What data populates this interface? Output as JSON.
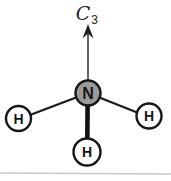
{
  "diagram": {
    "type": "molecular-structure",
    "rotation_axis_label": {
      "letter": "C",
      "subscript": "3"
    },
    "central_atom": {
      "symbol": "N"
    },
    "hydrogens": [
      {
        "symbol": "H",
        "position": "left"
      },
      {
        "symbol": "H",
        "position": "right"
      },
      {
        "symbol": "H",
        "position": "bottom"
      }
    ],
    "colors": {
      "bond": "#1c1c1c",
      "nitrogen_fill": "#9a9a9a",
      "hydrogen_fill": "#ffffff",
      "outline": "#161616",
      "scan_edge_line": "#c8c8c8",
      "background": "#ffffff"
    }
  }
}
